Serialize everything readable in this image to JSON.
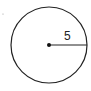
{
  "diagram": {
    "shape": "circle",
    "radius_label": "5",
    "colors": {
      "stroke": "#222222",
      "background": "#ffffff"
    }
  }
}
